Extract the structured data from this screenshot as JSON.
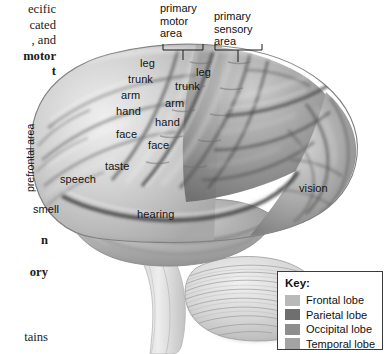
{
  "page": {
    "background_color": "#ffffff",
    "width": 387,
    "height": 354
  },
  "body_text_column": {
    "lines": [
      {
        "text": "ecific",
        "bold": false
      },
      {
        "text": "cated",
        "bold": false
      },
      {
        "text": ", and",
        "bold": false
      },
      {
        "text": "motor",
        "bold": true
      },
      {
        "text": "t",
        "bold": true
      }
    ],
    "fragment_n": "n",
    "fragment_ory": "ory",
    "fragment_tains": "tains"
  },
  "callouts": {
    "primary_motor": "primary\nmotor\narea",
    "primary_motor_lines": [
      "primary",
      "motor",
      "area"
    ],
    "primary_sensory_lines": [
      "primary",
      "sensory",
      "area"
    ]
  },
  "brain_labels": {
    "prefrontal_area": "prefrontal area",
    "motor_strip": [
      "leg",
      "trunk",
      "arm",
      "hand",
      "face"
    ],
    "sensory_strip": [
      "leg",
      "trunk",
      "arm",
      "hand",
      "face"
    ],
    "speech": "speech",
    "smell": "smell",
    "taste": "taste",
    "hearing": "hearing",
    "vision": "vision"
  },
  "key": {
    "title": "Key:",
    "items": [
      {
        "label": "Frontal lobe",
        "color": "#b9b9b9"
      },
      {
        "label": "Parietal lobe",
        "color": "#6f6f6f"
      },
      {
        "label": "Occipital lobe",
        "color": "#8e8e8e"
      },
      {
        "label": "Temporal lobe",
        "color": "#a3a3a3"
      }
    ]
  },
  "colors": {
    "ink": "#141414",
    "key_border": "#3a3a3a",
    "frontal": "#b9b9b9",
    "parietal": "#6f6f6f",
    "occipital": "#8e8e8e",
    "temporal": "#a3a3a3",
    "cerebellum": "#c9c9c9"
  }
}
